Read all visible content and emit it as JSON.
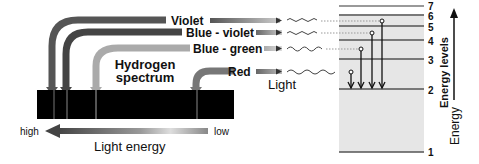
{
  "title_line1": "Hydrogen",
  "title_line2": "spectrum",
  "lines": [
    {
      "label": "Violet",
      "color": "#555555",
      "from_level": 6
    },
    {
      "label": "Blue - violet",
      "color": "#666666",
      "from_level": 5
    },
    {
      "label": "Blue - green",
      "color": "#aaaaaa",
      "from_level": 4
    },
    {
      "label": "Red",
      "color": "#777777",
      "from_level": 3
    }
  ],
  "light_label": "Light",
  "energy_levels": {
    "axis_label": "Energy levels",
    "levels": [
      "1",
      "2",
      "3",
      "4",
      "5",
      "6",
      "7"
    ],
    "target_level": "2"
  },
  "energy_axis_label": "Energy",
  "light_energy": {
    "label": "Light energy",
    "high": "high",
    "low": "low"
  }
}
